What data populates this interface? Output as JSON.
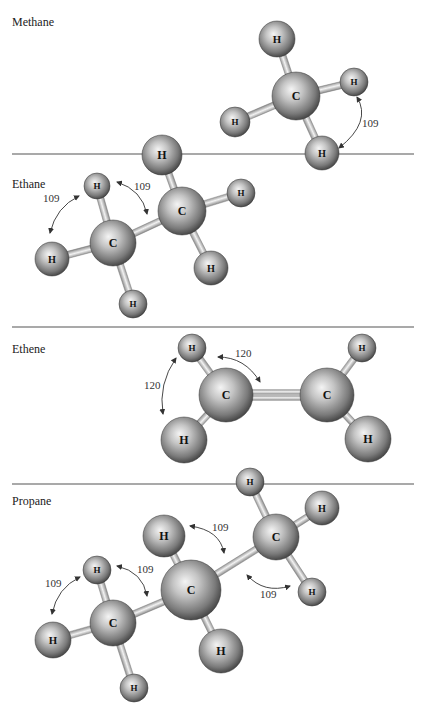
{
  "figure": {
    "width": 426,
    "height": 714,
    "colors": {
      "background": "#ffffff",
      "divider": "#555555",
      "atom_highlight": "#f2f2f2",
      "atom_mid": "#a9a9a9",
      "atom_shadow": "#3c3c3c",
      "bond_light": "#f0f0f0",
      "bond_dark": "#8a8a8a"
    },
    "dividers_y": [
      154,
      327,
      484
    ],
    "sections": [
      {
        "id": "methane",
        "label": "Methane",
        "label_pos": [
          12,
          26
        ],
        "atoms": [
          {
            "id": "H1",
            "el": "H",
            "x": 277,
            "y": 39,
            "r": 18
          },
          {
            "id": "C1",
            "el": "C",
            "x": 296,
            "y": 96,
            "r": 24
          },
          {
            "id": "H2",
            "el": "H",
            "x": 354,
            "y": 82,
            "r": 14
          },
          {
            "id": "H3",
            "el": "H",
            "x": 235,
            "y": 122,
            "r": 15
          },
          {
            "id": "H4",
            "el": "H",
            "x": 322,
            "y": 153,
            "r": 17
          }
        ],
        "bonds": [
          [
            "C1",
            "H1"
          ],
          [
            "C1",
            "H2"
          ],
          [
            "C1",
            "H3"
          ],
          [
            "C1",
            "H4"
          ]
        ],
        "angles": [
          {
            "label": "109",
            "pos": [
              362,
              127
            ],
            "arc": [
              357,
              97,
              339,
              148,
              372,
              122
            ]
          }
        ]
      },
      {
        "id": "ethane",
        "label": "Ethane",
        "label_pos": [
          12,
          188
        ],
        "atoms": [
          {
            "id": "H1",
            "el": "H",
            "x": 162,
            "y": 155,
            "r": 20
          },
          {
            "id": "H2",
            "el": "H",
            "x": 241,
            "y": 193,
            "r": 14
          },
          {
            "id": "H3",
            "el": "H",
            "x": 97,
            "y": 186,
            "r": 13
          },
          {
            "id": "C2",
            "el": "C",
            "x": 182,
            "y": 211,
            "r": 24
          },
          {
            "id": "C1",
            "el": "C",
            "x": 113,
            "y": 243,
            "r": 23
          },
          {
            "id": "H4",
            "el": "H",
            "x": 52,
            "y": 259,
            "r": 17
          },
          {
            "id": "H5",
            "el": "H",
            "x": 211,
            "y": 268,
            "r": 17
          },
          {
            "id": "H6",
            "el": "H",
            "x": 133,
            "y": 304,
            "r": 14
          }
        ],
        "bonds": [
          [
            "C1",
            "C2"
          ],
          [
            "C2",
            "H1"
          ],
          [
            "C2",
            "H2"
          ],
          [
            "C2",
            "H5"
          ],
          [
            "C1",
            "H3"
          ],
          [
            "C1",
            "H4"
          ],
          [
            "C1",
            "H6"
          ]
        ],
        "angles": [
          {
            "label": "109",
            "pos": [
              43,
              202
            ],
            "arc": [
              79,
              196,
              50,
              233,
              56,
              207
            ]
          },
          {
            "label": "109",
            "pos": [
              134,
              190
            ],
            "arc": [
              117,
              182,
              147,
              214,
              142,
              190
            ]
          }
        ]
      },
      {
        "id": "ethene",
        "label": "Ethene",
        "label_pos": [
          12,
          353
        ],
        "atoms": [
          {
            "id": "H1",
            "el": "H",
            "x": 192,
            "y": 348,
            "r": 14
          },
          {
            "id": "H2",
            "el": "H",
            "x": 362,
            "y": 348,
            "r": 14
          },
          {
            "id": "C1",
            "el": "C",
            "x": 226,
            "y": 395,
            "r": 27
          },
          {
            "id": "C2",
            "el": "C",
            "x": 327,
            "y": 395,
            "r": 27
          },
          {
            "id": "H3",
            "el": "H",
            "x": 184,
            "y": 440,
            "r": 23
          },
          {
            "id": "H4",
            "el": "H",
            "x": 368,
            "y": 439,
            "r": 23
          }
        ],
        "bonds": [
          [
            "C1",
            "H1"
          ],
          [
            "C1",
            "H3"
          ],
          [
            "C2",
            "H2"
          ],
          [
            "C2",
            "H4"
          ]
        ],
        "double_bonds": [
          [
            "C1",
            "C2"
          ]
        ],
        "angles": [
          {
            "label": "120",
            "pos": [
              144,
              389
            ],
            "arc": [
              176,
              358,
              163,
              414,
              158,
              384
            ]
          },
          {
            "label": "120",
            "pos": [
              235,
              357
            ],
            "arc": [
              218,
              357,
              260,
              382,
              245,
              357
            ]
          }
        ]
      },
      {
        "id": "propane",
        "label": "Propane",
        "label_pos": [
          12,
          505
        ],
        "atoms": [
          {
            "id": "H1",
            "el": "H",
            "x": 250,
            "y": 482,
            "r": 14
          },
          {
            "id": "H2",
            "el": "H",
            "x": 322,
            "y": 508,
            "r": 17
          },
          {
            "id": "C3",
            "el": "C",
            "x": 276,
            "y": 537,
            "r": 23
          },
          {
            "id": "H3",
            "el": "H",
            "x": 164,
            "y": 536,
            "r": 21
          },
          {
            "id": "H5",
            "el": "H",
            "x": 97,
            "y": 570,
            "r": 14
          },
          {
            "id": "H4",
            "el": "H",
            "x": 312,
            "y": 592,
            "r": 14
          },
          {
            "id": "C2",
            "el": "C",
            "x": 191,
            "y": 590,
            "r": 30
          },
          {
            "id": "C1",
            "el": "C",
            "x": 113,
            "y": 623,
            "r": 23
          },
          {
            "id": "H6",
            "el": "H",
            "x": 53,
            "y": 640,
            "r": 18
          },
          {
            "id": "H7",
            "el": "H",
            "x": 221,
            "y": 651,
            "r": 22
          },
          {
            "id": "H8",
            "el": "H",
            "x": 134,
            "y": 688,
            "r": 14
          }
        ],
        "bonds": [
          [
            "C1",
            "C2"
          ],
          [
            "C2",
            "C3"
          ],
          [
            "C3",
            "H1"
          ],
          [
            "C3",
            "H2"
          ],
          [
            "C3",
            "H4"
          ],
          [
            "C2",
            "H3"
          ],
          [
            "C2",
            "H7"
          ],
          [
            "C1",
            "H5"
          ],
          [
            "C1",
            "H6"
          ],
          [
            "C1",
            "H8"
          ]
        ],
        "angles": [
          {
            "label": "109",
            "pos": [
              212,
              531
            ],
            "arc": [
              190,
              526,
              224,
              553,
              220,
              530
            ]
          },
          {
            "label": "109",
            "pos": [
              45,
              587
            ],
            "arc": [
              80,
              577,
              52,
              614,
              57,
              588
            ]
          },
          {
            "label": "109",
            "pos": [
              137,
              573
            ],
            "arc": [
              117,
              566,
              147,
              596,
              143,
              572
            ]
          },
          {
            "label": "109",
            "pos": [
              260,
              598
            ],
            "arc": [
              247,
              575,
              290,
              586,
              264,
              594
            ]
          }
        ]
      }
    ]
  }
}
